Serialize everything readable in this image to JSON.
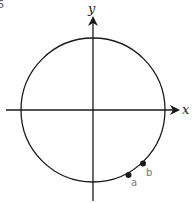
{
  "figure": {
    "corner_label": "6",
    "axes": {
      "x_label": "x",
      "y_label": "y"
    },
    "circle": {
      "cx": 93,
      "cy": 110,
      "r": 72
    },
    "points": [
      {
        "label": "a",
        "angle_deg": -60
      },
      {
        "label": "b",
        "angle_deg": -45
      }
    ],
    "colors": {
      "line": "#1a1a1a",
      "point_label": "#777777"
    }
  }
}
